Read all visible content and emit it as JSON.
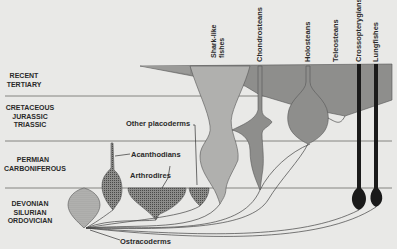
{
  "periods": [
    {
      "label": "RECENT\nTERTIARY"
    },
    {
      "label": "CRETACEOUS\nJURASSIC\nTRIASSIC"
    },
    {
      "label": "PERMIAN\nCARBONIFEROUS"
    },
    {
      "label": "DEVONIAN\nSILURIAN\nORDOVICIAN"
    }
  ],
  "groups": {
    "shark_like": "Shark-like fishes",
    "chondrosteans": "Chondrosteans",
    "holosteans": "Holosteans",
    "teleosteans": "Teleosteans",
    "crossopterygians": "Crossopterygians",
    "lungfishes": "Lungfishes"
  },
  "annotations": {
    "other_placoderms": "Other placoderms",
    "acanthodians": "Acanthodians",
    "arthrodires": "Arthrodires",
    "ostracoderms": "Ostracoderms"
  },
  "colors": {
    "background": "#e9e9e7",
    "light_gray": "#b5b5b3",
    "mid_gray": "#9a9a98",
    "dark_gray": "#8a8a88",
    "black": "#1a1a1a",
    "line": "#555555"
  }
}
